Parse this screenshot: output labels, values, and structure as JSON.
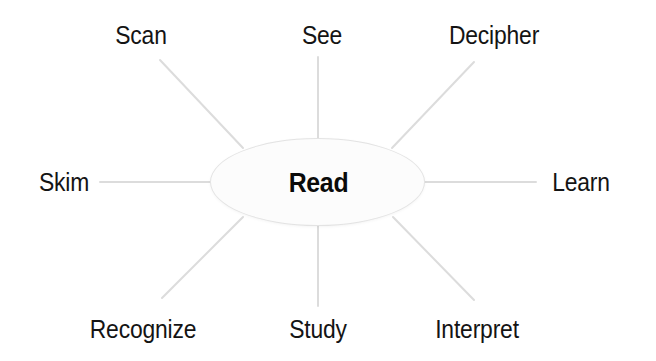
{
  "diagram": {
    "type": "radial-hub-and-spoke",
    "background_color": "#ffffff",
    "center": {
      "label": "Read",
      "shape": "ellipse",
      "fill_color": "#fcfcfc",
      "border_color": "#e3e3e3",
      "text_color": "#0a0a0a"
    },
    "spoke_color": "#dcdcdc",
    "label_color": "#141414",
    "nodes": [
      {
        "label": "Scan",
        "position": "upper-left",
        "angle_deg": 135
      },
      {
        "label": "See",
        "position": "top",
        "angle_deg": 90
      },
      {
        "label": "Decipher",
        "position": "upper-right",
        "angle_deg": 45
      },
      {
        "label": "Skim",
        "position": "left",
        "angle_deg": 180
      },
      {
        "label": "Learn",
        "position": "right",
        "angle_deg": 0
      },
      {
        "label": "Recognize",
        "position": "lower-left",
        "angle_deg": 225
      },
      {
        "label": "Study",
        "position": "bottom",
        "angle_deg": 270
      },
      {
        "label": "Interpret",
        "position": "lower-right",
        "angle_deg": 315
      }
    ]
  }
}
